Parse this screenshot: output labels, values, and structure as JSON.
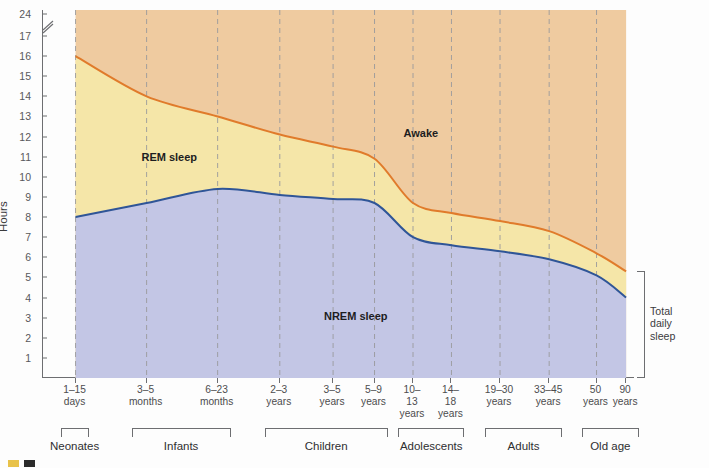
{
  "chart_data": {
    "type": "area",
    "title": "",
    "subtitle": "",
    "xlabel": "",
    "ylabel": "Hours",
    "ylim": [
      0,
      24
    ],
    "y_axis_break": {
      "between": [
        17,
        24
      ],
      "label": "axis-break"
    },
    "grid": "dashed vertical gridlines at each age tick",
    "legend_position": "inline labels inside plot areas",
    "y_ticks": [
      1,
      2,
      3,
      4,
      5,
      6,
      7,
      8,
      9,
      10,
      11,
      12,
      13,
      14,
      15,
      16,
      17,
      24
    ],
    "categories": [
      "1–15 days",
      "3–5 months",
      "6–23 months",
      "2–3 years",
      "3–5 years",
      "5–9 years",
      "10–13 years",
      "14–18 years",
      "19–30 years",
      "33–45 years",
      "50 years",
      "90 years"
    ],
    "x_tick_labels": [
      {
        "line1": "1–15",
        "line2": "days",
        "line3": ""
      },
      {
        "line1": "3–5",
        "line2": "months",
        "line3": ""
      },
      {
        "line1": "6–23",
        "line2": "months",
        "line3": ""
      },
      {
        "line1": "2–3",
        "line2": "years",
        "line3": ""
      },
      {
        "line1": "3–5",
        "line2": "years",
        "line3": ""
      },
      {
        "line1": "5–9",
        "line2": "years",
        "line3": ""
      },
      {
        "line1": "10–",
        "line2": "13",
        "line3": "years"
      },
      {
        "line1": "14–",
        "line2": "18",
        "line3": "years"
      },
      {
        "line1": "19–30",
        "line2": "years",
        "line3": ""
      },
      {
        "line1": "33–45",
        "line2": "years",
        "line3": ""
      },
      {
        "line1": "50",
        "line2": "years",
        "line3": ""
      },
      {
        "line1": "90",
        "line2": "years",
        "line3": ""
      }
    ],
    "series": [
      {
        "name": "NREM sleep",
        "color": "#C3C6E5",
        "line_color": "#2F5597",
        "values": [
          8.0,
          8.7,
          9.4,
          9.1,
          8.9,
          8.7,
          7.0,
          6.6,
          6.3,
          5.9,
          5.1,
          4.0
        ]
      },
      {
        "name": "REM sleep",
        "color": "#F5E6A8",
        "line_color": "#E07B2B",
        "values": [
          8.0,
          5.3,
          3.6,
          3.0,
          2.6,
          2.2,
          1.7,
          1.6,
          1.5,
          1.4,
          1.1,
          1.3
        ]
      },
      {
        "name": "Awake",
        "color": "#EFCBA0",
        "line_color": "",
        "values": [
          8.0,
          10.0,
          11.0,
          11.9,
          12.5,
          13.1,
          15.3,
          15.8,
          16.2,
          16.7,
          17.8,
          18.7
        ]
      }
    ],
    "total_daily_sleep": {
      "name": "Total daily sleep",
      "color": "#E07B2B",
      "values": [
        16.0,
        14.0,
        13.0,
        12.1,
        11.5,
        10.9,
        8.7,
        8.2,
        7.8,
        7.3,
        6.2,
        5.3
      ]
    },
    "annotations": [
      {
        "text": "Awake",
        "x_pct": 64.0,
        "y_value": 12.2
      },
      {
        "text": "REM sleep",
        "x_pct": 21.5,
        "y_value": 11.0
      },
      {
        "text": "NREM sleep",
        "x_pct": 53.0,
        "y_value": 3.1
      }
    ],
    "age_groups": [
      {
        "label": "Neonates",
        "start_index": 0,
        "end_index": 0
      },
      {
        "label": "Infants",
        "start_index": 1,
        "end_index": 2
      },
      {
        "label": "Children",
        "start_index": 3,
        "end_index": 5
      },
      {
        "label": "Adolescents",
        "start_index": 6,
        "end_index": 7
      },
      {
        "label": "Adults",
        "start_index": 8,
        "end_index": 9
      },
      {
        "label": "Old age",
        "start_index": 10,
        "end_index": 11
      }
    ],
    "right_bracket": {
      "line1": "Total",
      "line2": "daily",
      "line3": "sleep"
    }
  },
  "legend": {
    "items": [
      {
        "label": "",
        "color": "#E8C24A"
      },
      {
        "label": "",
        "color": "#2b2b2b"
      }
    ]
  },
  "colors": {
    "awake": "#EFCBA0",
    "rem": "#F5E6A8",
    "nrem": "#C3C6E5",
    "total_sleep_line": "#E07B2B",
    "nrem_line": "#2F5597",
    "axis": "#6d6e71",
    "gridline": "#9a9a9c",
    "text": "#4c4c4e"
  }
}
